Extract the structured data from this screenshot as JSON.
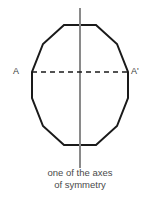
{
  "figure": {
    "type": "geometry-diagram",
    "width": 160,
    "height": 204,
    "background_color": "#ffffff"
  },
  "shape": {
    "name": "regular-dodecagon",
    "sides": 12,
    "stroke_color": "#1a1a1a",
    "stroke_width": 2,
    "fill": "none",
    "center": {
      "x": 80,
      "y": 85
    },
    "radius": 62,
    "vertices": [
      {
        "x": 64,
        "y": 25
      },
      {
        "x": 96,
        "y": 25
      },
      {
        "x": 117,
        "y": 44
      },
      {
        "x": 128,
        "y": 72
      },
      {
        "x": 128,
        "y": 98
      },
      {
        "x": 117,
        "y": 126
      },
      {
        "x": 96,
        "y": 145
      },
      {
        "x": 64,
        "y": 145
      },
      {
        "x": 43,
        "y": 126
      },
      {
        "x": 32,
        "y": 98
      },
      {
        "x": 32,
        "y": 72
      },
      {
        "x": 43,
        "y": 44
      }
    ]
  },
  "axis_of_symmetry": {
    "orientation": "vertical",
    "color": "#8a8a8a",
    "stroke_width": 2,
    "x": 80,
    "y_start": 8,
    "y_end": 168
  },
  "chord": {
    "name": "dashed-chord-AA-prime",
    "style": "dashed",
    "color": "#1a1a1a",
    "stroke_width": 1.6,
    "dash_pattern": "5,4",
    "x_start": 32,
    "x_end": 128,
    "y": 72
  },
  "labels": {
    "left_vertex": "A",
    "right_vertex": "A'",
    "color": "#3a3a3a"
  },
  "caption": {
    "line1": "one of the axes",
    "line2": "of symmetry",
    "color": "#4a4a4a"
  }
}
